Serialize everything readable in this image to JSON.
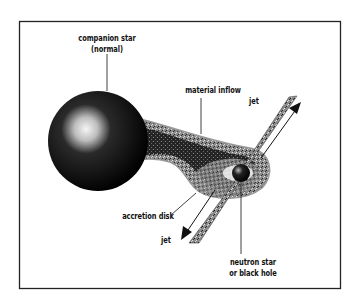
{
  "diagram": {
    "labels": {
      "companion_star_line1": "companion star",
      "companion_star_line2": "(normal)",
      "material_inflow": "material inflow",
      "jet_top": "jet",
      "accretion_disk": "accretion disk",
      "jet_bottom": "jet",
      "compact_object_line1": "neutron star",
      "compact_object_line2": "or black hole"
    },
    "colors": {
      "background": "#ffffff",
      "frame": "#222222",
      "ink": "#111111",
      "stipple_gray": "#9a9a9a",
      "highlight": "#f2f2f2"
    }
  }
}
